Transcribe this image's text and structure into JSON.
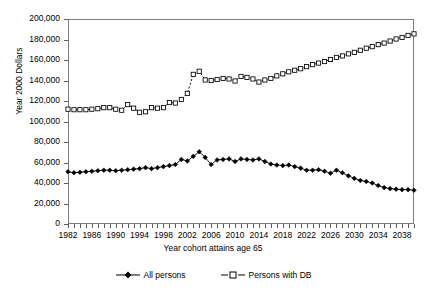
{
  "chart_data": {
    "type": "line",
    "title": "",
    "xlabel": "Year cohort attains age 65",
    "ylabel": "Year 2000 Dollars",
    "ylim": [
      0,
      200000
    ],
    "ytick_labels": [
      "200,000",
      "180,000",
      "160,000",
      "140,000",
      "120,000",
      "100,000",
      "80,000",
      "60,000",
      "40,000",
      "20,000",
      "0"
    ],
    "ytick_values": [
      200000,
      180000,
      160000,
      140000,
      120000,
      100000,
      80000,
      60000,
      40000,
      20000,
      0
    ],
    "xlim": [
      1982,
      2040
    ],
    "xtick_labels": [
      "1982",
      "1986",
      "1990",
      "1994",
      "1998",
      "2002",
      "2006",
      "2010",
      "2014",
      "2018",
      "2022",
      "2026",
      "2030",
      "2034",
      "2038"
    ],
    "xtick_values": [
      1982,
      1986,
      1990,
      1994,
      1998,
      2002,
      2006,
      2010,
      2014,
      2018,
      2022,
      2026,
      2030,
      2034,
      2038
    ],
    "grid": false,
    "legend_position": "bottom",
    "x": [
      1982,
      1983,
      1984,
      1985,
      1986,
      1987,
      1988,
      1989,
      1990,
      1991,
      1992,
      1993,
      1994,
      1995,
      1996,
      1997,
      1998,
      1999,
      2000,
      2001,
      2002,
      2003,
      2004,
      2005,
      2006,
      2007,
      2008,
      2009,
      2010,
      2011,
      2012,
      2013,
      2014,
      2015,
      2016,
      2017,
      2018,
      2019,
      2020,
      2021,
      2022,
      2023,
      2024,
      2025,
      2026,
      2027,
      2028,
      2029,
      2030,
      2031,
      2032,
      2033,
      2034,
      2035,
      2036,
      2037,
      2038,
      2039,
      2040
    ],
    "series": [
      {
        "name": "All persons",
        "marker": "filled-diamond",
        "line": "solid",
        "color": "#000000",
        "values": [
          51000,
          50000,
          50500,
          51000,
          51500,
          52000,
          52500,
          52500,
          52000,
          52500,
          53000,
          53500,
          54000,
          55000,
          54000,
          55000,
          56000,
          57000,
          58000,
          63000,
          61500,
          66000,
          70500,
          65000,
          58000,
          62500,
          63000,
          63500,
          61000,
          63500,
          63000,
          62500,
          63500,
          61000,
          58500,
          57500,
          57000,
          57500,
          56000,
          54500,
          52500,
          52500,
          53000,
          51500,
          49500,
          52500,
          50000,
          47000,
          44500,
          42500,
          41500,
          40000,
          37500,
          35500,
          34500,
          34000,
          33500,
          33500,
          33000
        ]
      },
      {
        "name": "Persons with DB",
        "marker": "open-square",
        "line": "dashed",
        "color": "#000000",
        "values": [
          112000,
          111500,
          111500,
          111500,
          112000,
          112500,
          113500,
          113500,
          112000,
          111000,
          116500,
          113000,
          109000,
          109500,
          113500,
          113000,
          113500,
          118500,
          118000,
          121500,
          127500,
          146000,
          149000,
          140500,
          140000,
          141000,
          142000,
          141500,
          139500,
          144000,
          143000,
          141500,
          138500,
          140500,
          142000,
          144500,
          146500,
          148500,
          150000,
          151500,
          153500,
          155500,
          157000,
          158500,
          160500,
          162500,
          164000,
          166000,
          167500,
          169500,
          171500,
          173000,
          175000,
          176500,
          178500,
          180500,
          182000,
          184000,
          185500
        ]
      }
    ]
  },
  "legend": {
    "items": [
      {
        "label": "All persons"
      },
      {
        "label": "Persons with DB"
      }
    ]
  }
}
